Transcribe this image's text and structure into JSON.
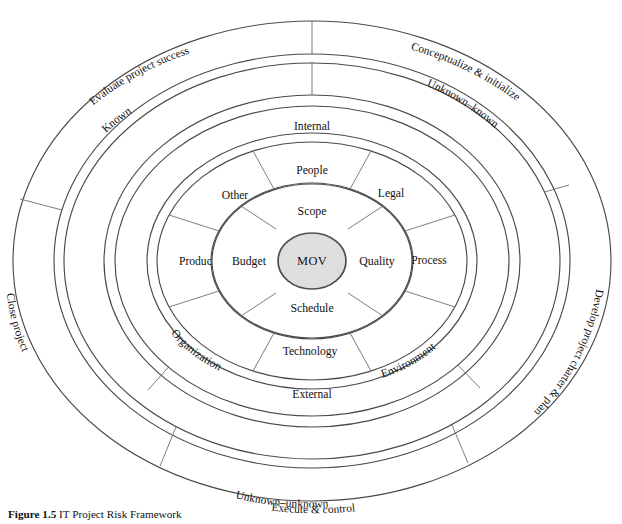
{
  "figure": {
    "caption_label": "Figure 1.5",
    "caption_text": "IT Project Risk Framework",
    "background_color": "#ffffff",
    "line_color": "#4a4a4a",
    "core_fill_color": "#dedede"
  },
  "core": {
    "label": "MOV"
  },
  "ring_inner": {
    "name": "project-objectives-ring",
    "segments": [
      {
        "label": "Scope"
      },
      {
        "label": "Quality"
      },
      {
        "label": "Schedule"
      },
      {
        "label": "Budget"
      }
    ]
  },
  "ring_mid": {
    "name": "risk-sources-ring",
    "segments": [
      {
        "label": "People"
      },
      {
        "label": "Legal"
      },
      {
        "label": "Process"
      },
      {
        "label": "Environment"
      },
      {
        "label": "Technology"
      },
      {
        "label": "Organization"
      },
      {
        "label": "Product"
      },
      {
        "label": "Other"
      }
    ]
  },
  "ring_internal_external": {
    "name": "internal-external-ring",
    "segments": [
      {
        "label": "Internal"
      },
      {
        "label": "External"
      }
    ]
  },
  "ring_knowledge": {
    "name": "knowledge-ring",
    "segments": [
      {
        "label": "Known"
      },
      {
        "label": "Unknown–known"
      },
      {
        "label": "Unknown–unknown"
      }
    ]
  },
  "ring_phases": {
    "name": "project-lifecycle-ring",
    "segments": [
      {
        "label": "Conceptualize & initialize"
      },
      {
        "label": "Develop project charter & plan"
      },
      {
        "label": "Execute & control"
      },
      {
        "label": "Close project"
      },
      {
        "label": "Evaluate project success"
      }
    ]
  }
}
